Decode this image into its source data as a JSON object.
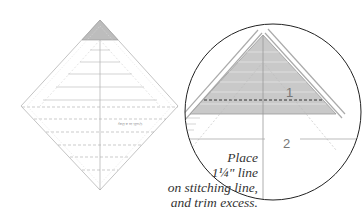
{
  "figure": {
    "caption_lines": [
      "Place",
      "1¼\" line",
      "on stitching line,",
      "and trim excess."
    ],
    "ruler_label": "Quilt in a Day",
    "detail_labels": [
      "1",
      "2"
    ],
    "colors": {
      "line": "#9a9a9a",
      "shaded_triangle": "#c8c8c8",
      "circle_stroke": "#222222",
      "dashed": "#333333",
      "text": "#333333"
    }
  }
}
